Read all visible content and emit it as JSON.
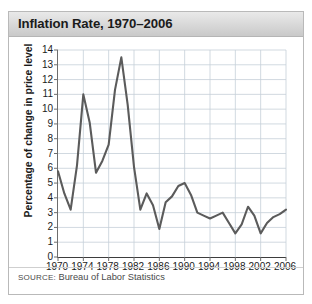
{
  "figure": {
    "title": "Inflation Rate, 1970–2006",
    "source_prefix": "SOURCE:",
    "source_text": " Bureau of Labor Statistics",
    "line_color": "#5b5b5b",
    "grid_color": "#c5cfd8",
    "title_bar_color": "#dcdcdc"
  },
  "chart_data": {
    "type": "line",
    "title": "Inflation Rate, 1970–2006",
    "xlabel": "",
    "ylabel": "Percentage of change in price level",
    "xlim": [
      1970,
      2006
    ],
    "ylim": [
      0,
      14
    ],
    "grid": true,
    "legend": "none",
    "ytick_labels": [
      "14",
      "13",
      "12",
      "11",
      "10",
      "9",
      "8",
      "7",
      "6",
      "5",
      "4",
      "3",
      "2",
      "1",
      "0"
    ],
    "ytick_values": [
      14,
      13,
      12,
      11,
      10,
      9,
      8,
      7,
      6,
      5,
      4,
      3,
      2,
      1,
      0
    ],
    "xtick_labels": [
      "1970",
      "1974",
      "1978",
      "1982",
      "1986",
      "1990",
      "1994",
      "1998",
      "2002",
      "2006"
    ],
    "xtick_values": [
      1970,
      1974,
      1978,
      1982,
      1986,
      1990,
      1994,
      1998,
      2002,
      2006
    ],
    "x": [
      1970,
      1971,
      1972,
      1973,
      1974,
      1975,
      1976,
      1977,
      1978,
      1979,
      1980,
      1981,
      1982,
      1983,
      1984,
      1985,
      1986,
      1987,
      1988,
      1989,
      1990,
      1991,
      1992,
      1993,
      1994,
      1995,
      1996,
      1997,
      1998,
      1999,
      2000,
      2001,
      2002,
      2003,
      2004,
      2005,
      2006
    ],
    "values": [
      5.8,
      4.3,
      3.2,
      6.2,
      11.0,
      9.1,
      5.7,
      6.5,
      7.6,
      11.3,
      13.5,
      10.3,
      6.1,
      3.2,
      4.3,
      3.5,
      1.9,
      3.7,
      4.1,
      4.8,
      5.0,
      4.2,
      3.0,
      2.8,
      2.6,
      2.8,
      3.0,
      2.3,
      1.6,
      2.2,
      3.4,
      2.8,
      1.6,
      2.3,
      2.7,
      2.9,
      3.2
    ],
    "series": [
      {
        "name": "Inflation rate",
        "values": [
          5.8,
          4.3,
          3.2,
          6.2,
          11.0,
          9.1,
          5.7,
          6.5,
          7.6,
          11.3,
          13.5,
          10.3,
          6.1,
          3.2,
          4.3,
          3.5,
          1.9,
          3.7,
          4.1,
          4.8,
          5.0,
          4.2,
          3.0,
          2.8,
          2.6,
          2.8,
          3.0,
          2.3,
          1.6,
          2.2,
          3.4,
          2.8,
          1.6,
          2.3,
          2.7,
          2.9,
          3.2
        ]
      }
    ]
  }
}
